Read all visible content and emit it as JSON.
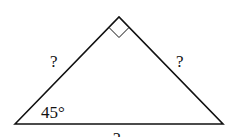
{
  "diagram": {
    "type": "right-isosceles-triangle",
    "vertices": {
      "left": [
        15,
        124
      ],
      "apex": [
        119,
        17
      ],
      "right": [
        223,
        124
      ]
    },
    "right_angle_at": "apex",
    "labels": {
      "left_side": "?",
      "right_side": "?",
      "base": "?",
      "angle_left": "45°"
    },
    "stroke_color": "#111111"
  }
}
